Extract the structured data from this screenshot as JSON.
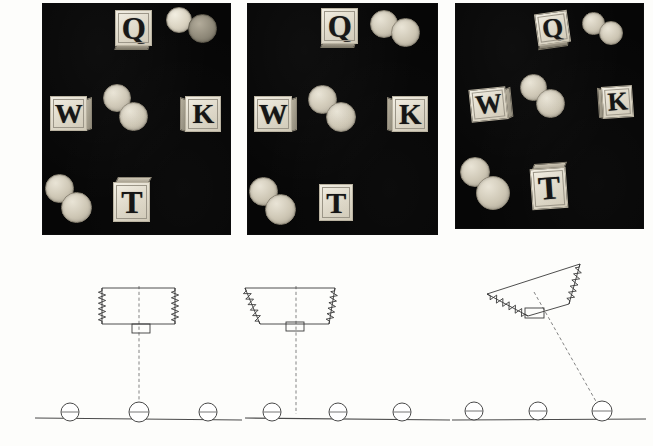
{
  "figure": {
    "background_color": "#fdfdfb",
    "width": 653,
    "height": 446,
    "photo_background_color": "#060606",
    "ink_color": "#3a3a3a"
  },
  "photo_panels": [
    {
      "id": "panel-1",
      "condition_label": "upright",
      "x": 43,
      "y": 4,
      "w": 187,
      "h": 230,
      "blocks": [
        {
          "letter": "Q",
          "x": 72,
          "y": 6,
          "w": 37,
          "h": 36,
          "rotation": 0,
          "depth": "bottom-front",
          "font_size": 31
        },
        {
          "letter": "W",
          "x": 7,
          "y": 92,
          "w": 37,
          "h": 35,
          "rotation": 0,
          "depth": "right-side",
          "font_size": 28
        },
        {
          "letter": "K",
          "x": 142,
          "y": 92,
          "w": 36,
          "h": 36,
          "rotation": 0,
          "depth": "left-side",
          "font_size": 28
        },
        {
          "letter": "T",
          "x": 70,
          "y": 178,
          "w": 37,
          "h": 40,
          "rotation": 0,
          "depth": "top",
          "font_size": 32
        }
      ],
      "coins": [
        {
          "x": 123,
          "y": 3,
          "d": 24,
          "shade": "bright"
        },
        {
          "x": 145,
          "y": 10,
          "d": 27,
          "shade": "dark"
        },
        {
          "x": 60,
          "y": 80,
          "d": 26,
          "shade": "normal"
        },
        {
          "x": 76,
          "y": 98,
          "d": 27,
          "shade": "normal"
        },
        {
          "x": 2,
          "y": 170,
          "d": 27,
          "shade": "normal"
        },
        {
          "x": 18,
          "y": 188,
          "d": 29,
          "shade": "normal"
        }
      ]
    },
    {
      "id": "panel-2",
      "condition_label": "sheared",
      "x": 248,
      "y": 4,
      "w": 189,
      "h": 230,
      "blocks": [
        {
          "letter": "Q",
          "x": 73,
          "y": 4,
          "w": 37,
          "h": 36,
          "rotation": 0,
          "depth": "bottom-front",
          "font_size": 31
        },
        {
          "letter": "W",
          "x": 6,
          "y": 92,
          "w": 38,
          "h": 36,
          "rotation": 0,
          "depth": "right-side",
          "font_size": 29
        },
        {
          "letter": "K",
          "x": 144,
          "y": 92,
          "w": 36,
          "h": 36,
          "rotation": 0,
          "depth": "left-side",
          "font_size": 29
        },
        {
          "letter": "T",
          "x": 71,
          "y": 180,
          "w": 34,
          "h": 37,
          "rotation": 0,
          "depth": "flat",
          "font_size": 30
        }
      ],
      "coins": [
        {
          "x": 122,
          "y": 6,
          "d": 26,
          "shade": "normal"
        },
        {
          "x": 143,
          "y": 14,
          "d": 27,
          "shade": "normal"
        },
        {
          "x": 60,
          "y": 81,
          "d": 27,
          "shade": "normal"
        },
        {
          "x": 78,
          "y": 98,
          "d": 28,
          "shade": "normal"
        },
        {
          "x": 1,
          "y": 173,
          "d": 27,
          "shade": "normal"
        },
        {
          "x": 17,
          "y": 190,
          "d": 29,
          "shade": "normal"
        }
      ]
    },
    {
      "id": "panel-3",
      "condition_label": "rotated",
      "x": 456,
      "y": 4,
      "w": 187,
      "h": 224,
      "blocks": [
        {
          "letter": "Q",
          "x": 80,
          "y": 8,
          "w": 33,
          "h": 32,
          "rotation": -8,
          "depth": "bottom-front",
          "font_size": 27
        },
        {
          "letter": "W",
          "x": 14,
          "y": 84,
          "w": 37,
          "h": 33,
          "rotation": -6,
          "depth": "right-side",
          "font_size": 27
        },
        {
          "letter": "K",
          "x": 146,
          "y": 82,
          "w": 31,
          "h": 32,
          "rotation": -4,
          "depth": "left-side",
          "font_size": 26
        },
        {
          "letter": "T",
          "x": 75,
          "y": 164,
          "w": 36,
          "h": 41,
          "rotation": -4,
          "depth": "top",
          "font_size": 33
        }
      ],
      "coins": [
        {
          "x": 126,
          "y": 8,
          "d": 21,
          "shade": "normal"
        },
        {
          "x": 143,
          "y": 17,
          "d": 22,
          "shade": "normal"
        },
        {
          "x": 64,
          "y": 70,
          "d": 25,
          "shade": "normal"
        },
        {
          "x": 80,
          "y": 85,
          "d": 27,
          "shade": "normal"
        },
        {
          "x": 4,
          "y": 153,
          "d": 28,
          "shade": "normal"
        },
        {
          "x": 20,
          "y": 172,
          "d": 32,
          "shade": "normal"
        }
      ]
    }
  ],
  "diagrams": [
    {
      "id": "diagram-1",
      "label": "upright-spring-mass",
      "x": 30,
      "y": 262,
      "w": 215,
      "h": 180,
      "body_polygon": "72,26 145,26 145,62 72,62",
      "tab_rect": {
        "x": 102,
        "y": 62,
        "w": 18,
        "h": 9
      },
      "center_line": {
        "x1": 109,
        "y1": 24,
        "x2": 109,
        "y2": 151
      },
      "ground_line": {
        "x1": 5,
        "y1": 156,
        "x2": 212,
        "y2": 158
      },
      "rollers": [
        {
          "cx": 40,
          "cy": 150,
          "r": 9
        },
        {
          "cx": 109,
          "cy": 150,
          "r": 10
        },
        {
          "cx": 178,
          "cy": 150,
          "r": 9
        }
      ],
      "springs": [
        {
          "x1": 72,
          "y1": 26,
          "x2": 72,
          "y2": 62,
          "coils": 11,
          "amp": 3.6
        },
        {
          "x1": 145,
          "y1": 26,
          "x2": 145,
          "y2": 62,
          "coils": 11,
          "amp": 3.6
        }
      ]
    },
    {
      "id": "diagram-2",
      "label": "sheared-spring-mass",
      "x": 235,
      "y": 262,
      "w": 215,
      "h": 180,
      "body_polygon": "10,26 100,26 94,62 25,62",
      "tab_rect": {
        "x": 51,
        "y": 60,
        "w": 18,
        "h": 9
      },
      "center_line": {
        "x1": 61,
        "y1": 24,
        "x2": 61,
        "y2": 152
      },
      "ground_line": {
        "x1": 10,
        "y1": 156,
        "x2": 215,
        "y2": 158
      },
      "rollers": [
        {
          "cx": 37,
          "cy": 150,
          "r": 9
        },
        {
          "cx": 103,
          "cy": 150,
          "r": 9
        },
        {
          "cx": 167,
          "cy": 150,
          "r": 9
        }
      ],
      "springs": [
        {
          "x1": 10,
          "y1": 26,
          "x2": 25,
          "y2": 62,
          "coils": 11,
          "amp": 3.6
        },
        {
          "x1": 100,
          "y1": 26,
          "x2": 94,
          "y2": 62,
          "coils": 11,
          "amp": 3.6
        }
      ]
    },
    {
      "id": "diagram-3",
      "label": "rotated-spring-mass",
      "x": 450,
      "y": 256,
      "w": 200,
      "h": 186,
      "body_polygon": "130,8 119,48 78,60 37,38",
      "tab_rect": {
        "x": 75,
        "y": 52,
        "w": 19,
        "h": 10
      },
      "center_line": {
        "x1": 84,
        "y1": 36,
        "x2": 152,
        "y2": 156
      },
      "ground_line": {
        "x1": 2,
        "y1": 164,
        "x2": 196,
        "y2": 163
      },
      "rollers": [
        {
          "cx": 24,
          "cy": 155,
          "r": 9
        },
        {
          "cx": 88,
          "cy": 155,
          "r": 9
        },
        {
          "cx": 152,
          "cy": 155,
          "r": 10
        }
      ],
      "springs": [
        {
          "x1": 130,
          "y1": 8,
          "x2": 119,
          "y2": 48,
          "coils": 11,
          "amp": 3.6
        },
        {
          "x1": 37,
          "y1": 38,
          "x2": 78,
          "y2": 60,
          "coils": 11,
          "amp": 3.6
        }
      ]
    }
  ]
}
